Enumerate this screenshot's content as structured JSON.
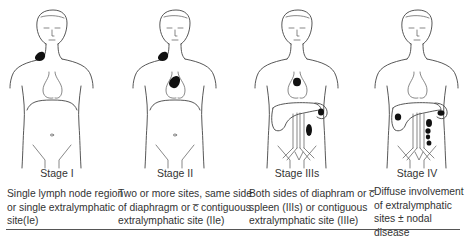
{
  "figures": [
    {
      "id": "stage-1",
      "label": "Stage I",
      "description_lines": [
        "Single lymph node region",
        "or single extralymphatic",
        "site(Ie)"
      ],
      "lesions": [
        "left cervical lymph node"
      ],
      "shows_abdominal_organs": false
    },
    {
      "id": "stage-2",
      "label": "Stage II",
      "description_lines": [
        "Two or more sites, same side",
        "of diaphragm or c̅ contiguous",
        "extralymphatic site (IIe)"
      ],
      "lesions": [
        "left cervical lymph node",
        "mediastinal node"
      ],
      "shows_abdominal_organs": false
    },
    {
      "id": "stage-3s",
      "label": "Stage IIIs",
      "description_lines": [
        "Both sides of diaphram or c̅",
        "spleen (IIIs) or contiguous",
        "extralymphatic site (IIIe)"
      ],
      "lesions": [
        "mediastinal node",
        "spleen",
        "para-aortic node"
      ],
      "shows_abdominal_organs": true
    },
    {
      "id": "stage-4",
      "label": "Stage IV",
      "description_lines": [
        "Diffuse involvement",
        "of extralymphatic",
        "sites ± nodal disease"
      ],
      "lesions": [
        "liver",
        "spleen",
        "para-aortic nodes (x4)"
      ],
      "shows_abdominal_organs": true
    }
  ],
  "colors": {
    "outline": "#444444",
    "lesion": "#111111",
    "text": "#333333",
    "rule": "#555555"
  }
}
